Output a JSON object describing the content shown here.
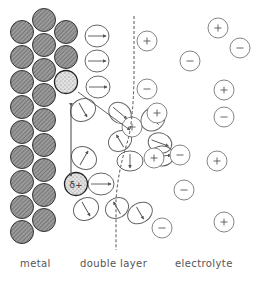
{
  "figure": {
    "labels": {
      "metal": "metal",
      "double_layer": "double layer",
      "electrolyte": "electrolyte"
    },
    "adsorbed_ion_label": "δ+",
    "colors": {
      "stroke": "#444444",
      "light_stroke": "#888888",
      "metal_fill": "#8c8c8c",
      "adsorbed_fill": "#d4d4d4"
    },
    "metal_atoms": [
      {
        "cx": 22,
        "cy": 32
      },
      {
        "cx": 22,
        "cy": 57
      },
      {
        "cx": 22,
        "cy": 82
      },
      {
        "cx": 22,
        "cy": 107
      },
      {
        "cx": 22,
        "cy": 132
      },
      {
        "cx": 22,
        "cy": 157
      },
      {
        "cx": 22,
        "cy": 182
      },
      {
        "cx": 22,
        "cy": 207
      },
      {
        "cx": 22,
        "cy": 232
      },
      {
        "cx": 44,
        "cy": 20
      },
      {
        "cx": 44,
        "cy": 45
      },
      {
        "cx": 44,
        "cy": 70
      },
      {
        "cx": 44,
        "cy": 95
      },
      {
        "cx": 44,
        "cy": 120
      },
      {
        "cx": 44,
        "cy": 145
      },
      {
        "cx": 44,
        "cy": 170
      },
      {
        "cx": 44,
        "cy": 195
      },
      {
        "cx": 44,
        "cy": 220
      },
      {
        "cx": 66,
        "cy": 32
      },
      {
        "cx": 66,
        "cy": 57
      }
    ],
    "adsorbed_ions": [
      {
        "cx": 66,
        "cy": 82,
        "label": ""
      },
      {
        "cx": 76,
        "cy": 184,
        "label": "δ+"
      }
    ],
    "water_molecules": [
      {
        "cx": 97,
        "cy": 36,
        "rx": 12,
        "ry": 11,
        "angle": 0
      },
      {
        "cx": 97,
        "cy": 61,
        "rx": 12,
        "ry": 11,
        "angle": 0
      },
      {
        "cx": 98,
        "cy": 87,
        "rx": 12,
        "ry": 11,
        "angle": 0
      },
      {
        "cx": 83,
        "cy": 110,
        "rx": 11,
        "ry": 13,
        "angle": 60
      },
      {
        "cx": 84,
        "cy": 158,
        "rx": 11,
        "ry": 13,
        "angle": -60
      },
      {
        "cx": 101,
        "cy": 184,
        "rx": 13,
        "ry": 11,
        "angle": 0
      },
      {
        "cx": 86,
        "cy": 209,
        "rx": 11,
        "ry": 13,
        "angle": 60
      },
      {
        "cx": 120,
        "cy": 113,
        "rx": 12,
        "ry": 10,
        "angle": 40
      },
      {
        "cx": 120,
        "cy": 141,
        "rx": 10,
        "ry": 12,
        "angle": -120
      },
      {
        "cx": 130,
        "cy": 161,
        "rx": 10,
        "ry": 13,
        "angle": 90
      },
      {
        "cx": 117,
        "cy": 208,
        "rx": 10,
        "ry": 12,
        "angle": 240
      },
      {
        "cx": 140,
        "cy": 213,
        "rx": 10,
        "ry": 13,
        "angle": 60
      },
      {
        "cx": 153,
        "cy": 119,
        "rx": 11,
        "ry": 13,
        "angle": 225
      },
      {
        "cx": 160,
        "cy": 143,
        "rx": 12,
        "ry": 10,
        "angle": 20
      },
      {
        "cx": 162,
        "cy": 156,
        "rx": 12,
        "ry": 10,
        "angle": -5
      }
    ],
    "ions": [
      {
        "cx": 147,
        "cy": 41,
        "sign": "+"
      },
      {
        "cx": 147,
        "cy": 89,
        "sign": "−"
      },
      {
        "cx": 157,
        "cy": 113,
        "sign": "+"
      },
      {
        "cx": 132,
        "cy": 127,
        "sign": "+"
      },
      {
        "cx": 154,
        "cy": 158,
        "sign": "+"
      },
      {
        "cx": 180,
        "cy": 155,
        "sign": "−"
      },
      {
        "cx": 184,
        "cy": 190,
        "sign": "−"
      },
      {
        "cx": 162,
        "cy": 228,
        "sign": "−"
      },
      {
        "cx": 190,
        "cy": 61,
        "sign": "−"
      },
      {
        "cx": 218,
        "cy": 28,
        "sign": "+"
      },
      {
        "cx": 240,
        "cy": 48,
        "sign": "−"
      },
      {
        "cx": 224,
        "cy": 90,
        "sign": "+"
      },
      {
        "cx": 224,
        "cy": 117,
        "sign": "−"
      },
      {
        "cx": 217,
        "cy": 161,
        "sign": "+"
      },
      {
        "cx": 224,
        "cy": 222,
        "sign": "+"
      }
    ],
    "lines": {
      "inner_plane": {
        "x1": 71,
        "y1": 106,
        "x2": 71,
        "y2": 176
      },
      "outer_plane_path": "M134 16 L134 80 Q133 120 128 140 Q118 170 116 200 L116 250"
    }
  }
}
